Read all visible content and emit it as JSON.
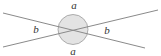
{
  "diagram": {
    "type": "vertically-opposite-angles",
    "labels": {
      "top": "a",
      "bottom": "a",
      "left": "b",
      "right": "b"
    },
    "colors": {
      "line": "#8a8a8a",
      "circle_fill": "#e3e3e3",
      "circle_stroke": "#9a9a9a",
      "label": "#333333"
    }
  }
}
